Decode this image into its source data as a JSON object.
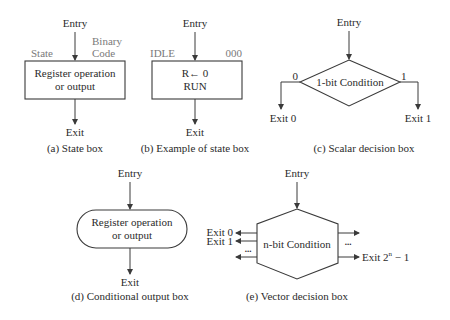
{
  "figure": {
    "state_box": {
      "entry": "Entry",
      "state_label": "State",
      "binary_label_1": "Binary",
      "binary_label_2": "Code",
      "line1": "Register operation",
      "line2": "or output",
      "exit": "Exit",
      "caption": "(a) State box"
    },
    "state_box_example": {
      "entry": "Entry",
      "state_name": "IDLE",
      "binary_code": "000",
      "line1": "R← 0",
      "line2": "RUN",
      "exit": "Exit",
      "caption": "(b) Example of state box"
    },
    "scalar_decision": {
      "entry": "Entry",
      "condition": "1-bit Condition",
      "label_0": "0",
      "label_1": "1",
      "exit_0": "Exit 0",
      "exit_1": "Exit 1",
      "caption": "(c) Scalar decision box"
    },
    "conditional_output": {
      "entry": "Entry",
      "line1": "Register operation",
      "line2": "or output",
      "exit": "Exit",
      "caption": "(d) Conditional output box"
    },
    "vector_decision": {
      "entry": "Entry",
      "condition": "n-bit Condition",
      "exit_0": "Exit 0",
      "exit_1": "Exit 1",
      "ellipsis_left": "...",
      "ellipsis_right": "...",
      "exit_last_prefix": "Exit 2",
      "exit_last_sup": "n",
      "exit_last_suffix": " − 1",
      "caption": "(e) Vector decision box"
    }
  }
}
